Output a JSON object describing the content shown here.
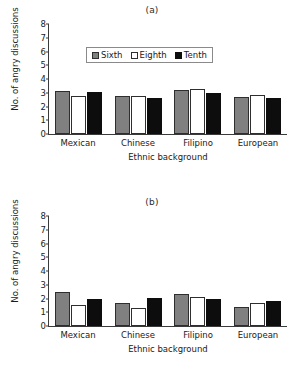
{
  "figure": {
    "panel_a_label": "(a)",
    "panel_b_label": "(b)"
  },
  "legend": {
    "items": [
      {
        "label": "Sixth",
        "color": "#808080",
        "swatch": "sixth"
      },
      {
        "label": "Eighth",
        "color": "#ffffff",
        "swatch": "eighth"
      },
      {
        "label": "Tenth",
        "color": "#0d0d0d",
        "swatch": "tenth"
      }
    ]
  },
  "axis": {
    "ylabel": "No. of angry discussions",
    "xlabel": "Ethnic background",
    "yticks": [
      "8",
      "7",
      "6",
      "5",
      "4",
      "3",
      "2",
      "1",
      "0"
    ]
  },
  "chart_data": [
    {
      "type": "bar",
      "title": "(a)",
      "xlabel": "Ethnic background",
      "ylabel": "No. of angry discussions",
      "ylim": [
        0,
        8
      ],
      "ytick_values": [
        0,
        1,
        2,
        3,
        4,
        5,
        6,
        7,
        8
      ],
      "grid": false,
      "legend_position": "upper-center",
      "categories": [
        "Mexican",
        "Chinese",
        "Filipino",
        "European"
      ],
      "series": [
        {
          "name": "Sixth",
          "color": "#808080",
          "values": [
            3.1,
            2.8,
            3.2,
            2.7
          ]
        },
        {
          "name": "Eighth",
          "color": "#ffffff",
          "values": [
            2.75,
            2.75,
            3.3,
            2.85
          ]
        },
        {
          "name": "Tenth",
          "color": "#0d0d0d",
          "values": [
            3.05,
            2.6,
            3.0,
            2.6
          ]
        }
      ]
    },
    {
      "type": "bar",
      "title": "(b)",
      "xlabel": "Ethnic background",
      "ylabel": "No. of angry discussions",
      "ylim": [
        0,
        8
      ],
      "ytick_values": [
        0,
        1,
        2,
        3,
        4,
        5,
        6,
        7,
        8
      ],
      "grid": false,
      "legend_position": "none",
      "categories": [
        "Mexican",
        "Chinese",
        "Filipino",
        "European"
      ],
      "series": [
        {
          "name": "Sixth",
          "color": "#808080",
          "values": [
            2.5,
            1.7,
            2.35,
            1.35
          ]
        },
        {
          "name": "Eighth",
          "color": "#ffffff",
          "values": [
            1.5,
            1.3,
            2.1,
            1.65
          ]
        },
        {
          "name": "Tenth",
          "color": "#0d0d0d",
          "values": [
            1.95,
            2.05,
            1.95,
            1.8
          ]
        }
      ]
    }
  ]
}
